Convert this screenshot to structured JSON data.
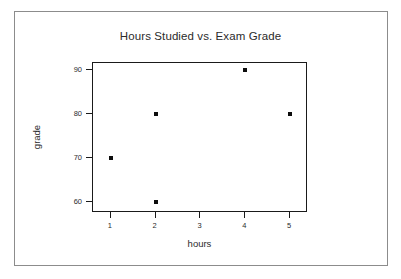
{
  "chart_data": {
    "type": "scatter",
    "title": "Hours Studied vs. Exam Grade",
    "xlabel": "hours",
    "ylabel": "grade",
    "x": [
      1,
      2,
      2,
      4,
      5
    ],
    "y": [
      70,
      80,
      60,
      90,
      80
    ],
    "points": [
      {
        "x": 1,
        "y": 70
      },
      {
        "x": 2,
        "y": 80
      },
      {
        "x": 2,
        "y": 60
      },
      {
        "x": 4,
        "y": 90
      },
      {
        "x": 5,
        "y": 80
      }
    ],
    "xlim": [
      0.6,
      5.4
    ],
    "ylim": [
      57.5,
      91.5
    ],
    "xticks": [
      1,
      2,
      3,
      4,
      5
    ],
    "yticks": [
      60,
      70,
      80,
      90
    ],
    "xtick_labels": [
      "1",
      "2",
      "3",
      "4",
      "5"
    ],
    "ytick_labels": [
      "60",
      "70",
      "80",
      "90"
    ],
    "grid": false,
    "legend": null,
    "marker": "square",
    "marker_color": "#0d0d0d",
    "axis_color": "#1a1a1a",
    "text_color": "#2b2b2b",
    "frame_color": "#8c8c8c",
    "background": "#ffffff"
  }
}
